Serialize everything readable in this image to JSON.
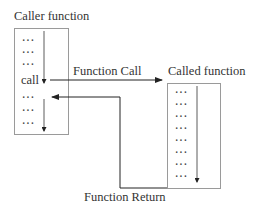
{
  "diagram": {
    "caller": {
      "title": "Caller function",
      "rows": [
        "···",
        "···",
        "···",
        "call",
        "···",
        "···",
        "···"
      ]
    },
    "called": {
      "title": "Called function",
      "rows": [
        "···",
        "···",
        "···",
        "···",
        "···",
        "···",
        "···",
        "···"
      ]
    },
    "arrows": {
      "call_label": "Function Call",
      "return_label": "Function Return"
    },
    "colors": {
      "box_stroke": "#9a9a9a",
      "arrow_stroke": "#222222"
    }
  }
}
